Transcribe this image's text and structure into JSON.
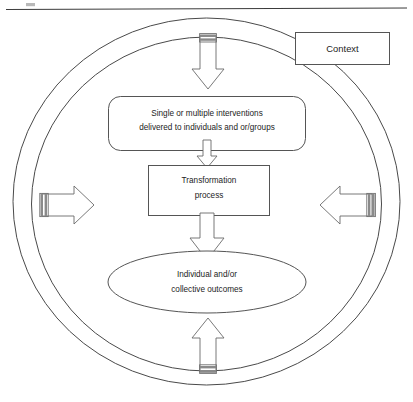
{
  "figure": {
    "header_rule": "horizontal-rule",
    "boundary": {
      "outer_ring_label": "outer-boundary-circle",
      "inner_ring_label": "inner-boundary-circle"
    },
    "nodes": {
      "context": {
        "label": "Context",
        "shape": "rectangle"
      },
      "interventions": {
        "line1": "Single or multiple interventions",
        "line2": "delivered to individuals and or/groups",
        "shape": "rounded-rectangle"
      },
      "transformation": {
        "line1": "Transformation",
        "line2": "process",
        "shape": "rectangle"
      },
      "outcomes": {
        "line1": "Individual and/or",
        "line2": "collective outcomes",
        "shape": "ellipse"
      }
    },
    "arrows": {
      "top": {
        "name": "context-arrow-top",
        "direction": "down"
      },
      "left": {
        "name": "context-arrow-left",
        "direction": "right"
      },
      "right": {
        "name": "context-arrow-right",
        "direction": "left"
      },
      "bottom": {
        "name": "context-arrow-bottom",
        "direction": "up"
      },
      "flow_interventions_to_transformation": {
        "name": "flow-arrow-interventions-to-transformation",
        "direction": "down"
      },
      "flow_transformation_to_outcomes": {
        "name": "flow-arrow-transformation-to-outcomes",
        "direction": "down"
      }
    },
    "colors": {
      "stroke": "#555555",
      "text": "#1c1c1c",
      "background": "#ffffff",
      "arrow_tail": "#8a8a8a"
    }
  }
}
